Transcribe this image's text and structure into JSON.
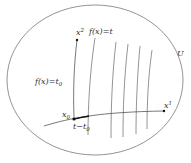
{
  "diagram": {
    "set_label": "U",
    "axis_x1_label": "x",
    "axis_x1_sup": "1",
    "axis_x2_label": "x",
    "axis_x2_sup": "2",
    "level_curve_label": "f(x)=t",
    "base_level_label_main": "f(x)=t",
    "base_level_label_sub": "0",
    "point_label_main": "x",
    "point_label_sub": "0",
    "segment_label_main": "t−t",
    "segment_label_sub": "0",
    "colors": {
      "stroke": "#555555",
      "text": "#333333",
      "point": "#111111"
    }
  }
}
